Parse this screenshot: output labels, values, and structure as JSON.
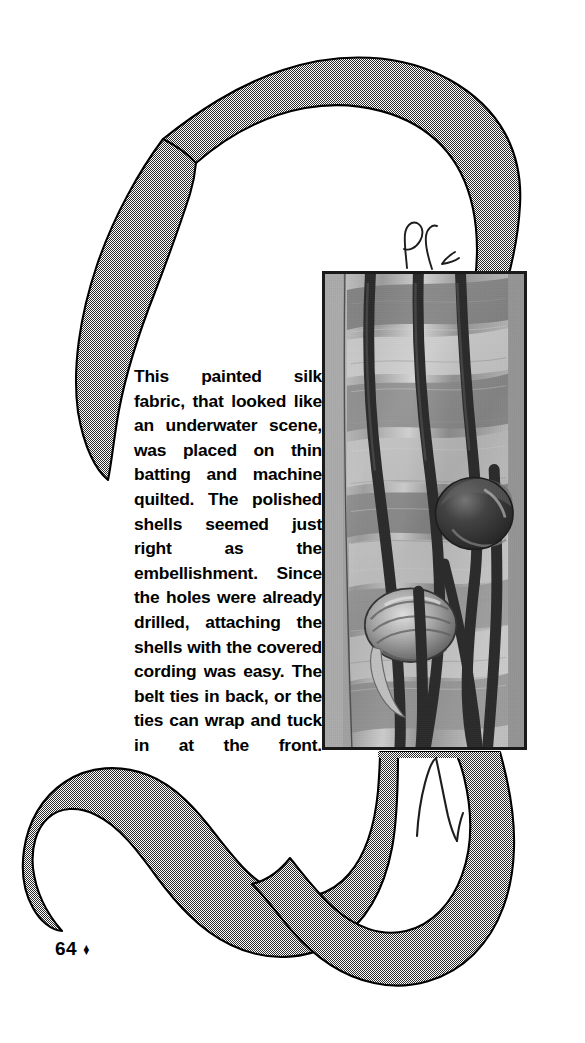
{
  "page": {
    "width": 585,
    "height": 1043,
    "background_color": "#ffffff",
    "ink_color": "#000000"
  },
  "caption": {
    "body": "This painted silk fabric, that looked like an underwater scene, was placed on thin batting and machine quilted. The polished shells seemed just right as the embellishment. Since the holes were already drilled, attaching the shells with the covered cording was easy. The belt ties in back, or the ties can wrap and tuck in at the front."
  },
  "photo": {
    "description": "Black and white halftone photograph of a hand-painted silk quilted belt with dark covered cording and two polished shells",
    "frame_color": "#1a1a1a",
    "base_tone": "#9a9a9a"
  },
  "artwork": {
    "name": "decorative-halftone-ribbon",
    "fill_tone": "#b8b8b8",
    "outline_color": "#000000",
    "pen_mark_color": "#1a1a1a"
  },
  "folio": {
    "page_number": "64",
    "ornament": "♦"
  }
}
